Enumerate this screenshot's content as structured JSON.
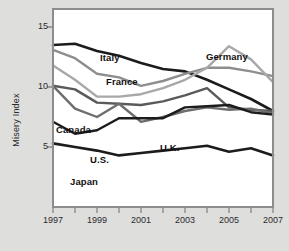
{
  "chart_data": {
    "type": "line",
    "title": "",
    "xlabel": "",
    "ylabel": "Misery Index",
    "x": [
      1997,
      1998,
      1999,
      2000,
      2001,
      2002,
      2003,
      2004,
      2005,
      2006,
      2007
    ],
    "xlim": [
      1997,
      2007
    ],
    "ylim": [
      0,
      16.5
    ],
    "yticks": [
      5,
      10,
      15
    ],
    "ytick_labels": [
      "5",
      "10",
      "15"
    ],
    "xticks": [
      1997,
      1999,
      2001,
      2003,
      2005,
      2007
    ],
    "xtick_labels": [
      "1997",
      "1999",
      "2001",
      "2003",
      "2005",
      "2007"
    ],
    "grid": false,
    "legend": "inline-labels",
    "series": [
      {
        "name": "Italy",
        "color": "#1c1c1c",
        "width": 2.6,
        "values": [
          13.5,
          13.6,
          13.0,
          12.6,
          12.0,
          11.5,
          11.3,
          10.6,
          9.8,
          9.0,
          8.0
        ],
        "label_x": 100,
        "label_y": 52
      },
      {
        "name": "France",
        "color": "#8e8e8e",
        "width": 2.4,
        "values": [
          13.1,
          12.4,
          11.1,
          10.8,
          10.1,
          10.5,
          11.1,
          11.6,
          11.6,
          11.3,
          10.9
        ],
        "label_x": 106,
        "label_y": 76
      },
      {
        "name": "Germany",
        "color": "#a8a8a8",
        "width": 2.4,
        "values": [
          11.8,
          10.6,
          9.2,
          9.2,
          9.4,
          9.9,
          10.6,
          11.6,
          13.4,
          12.3,
          10.4
        ],
        "label_x": 206,
        "label_y": 51
      },
      {
        "name": "Canada",
        "color": "#5a5a5a",
        "width": 2.4,
        "values": [
          10.1,
          9.8,
          8.7,
          8.6,
          8.5,
          8.8,
          9.3,
          9.9,
          8.3,
          8.1,
          8.0
        ],
        "label_x": 56,
        "label_y": 124
      },
      {
        "name": "U.K.",
        "color": "#6e6e6e",
        "width": 2.4,
        "values": [
          10.1,
          8.2,
          7.5,
          8.6,
          7.1,
          7.5,
          8.0,
          8.3,
          8.1,
          8.2,
          7.8
        ],
        "label_x": 160,
        "label_y": 142
      },
      {
        "name": "U.S.",
        "color": "#1c1c1c",
        "width": 2.4,
        "values": [
          7.1,
          6.1,
          6.4,
          7.4,
          7.4,
          7.4,
          8.3,
          8.4,
          8.5,
          7.9,
          7.7
        ],
        "label_x": 90,
        "label_y": 154
      },
      {
        "name": "Japan",
        "color": "#1c1c1c",
        "width": 2.6,
        "values": [
          5.3,
          5.0,
          4.7,
          4.3,
          4.5,
          4.7,
          4.9,
          5.1,
          4.6,
          4.9,
          4.3
        ],
        "label_x": 70,
        "label_y": 176
      }
    ]
  },
  "caption": {
    "text": ""
  }
}
